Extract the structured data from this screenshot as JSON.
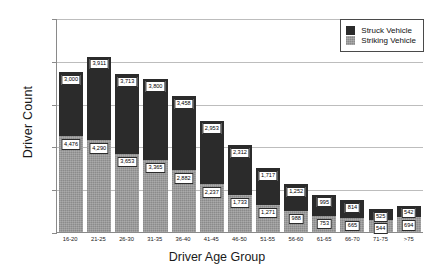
{
  "chart_data": {
    "type": "bar",
    "stacked": true,
    "title": "",
    "xlabel": "Driver Age Group",
    "ylabel": "Driver Count",
    "ylim": [
      0,
      10000
    ],
    "yticks": [
      "0",
      "2,000",
      "4,000",
      "6,000",
      "8,000",
      "10,000"
    ],
    "ytick_values": [
      0,
      2000,
      4000,
      6000,
      8000,
      10000
    ],
    "grid": true,
    "legend_position": "top-right",
    "categories": [
      "16-20",
      "21-25",
      "26-30",
      "31-35",
      "36-40",
      "41-45",
      "46-50",
      "51-55",
      "56-60",
      "61-65",
      "66-70",
      "71-75",
      ">75"
    ],
    "series": [
      {
        "name": "Struck Vehicle",
        "color": "#2b2b2b",
        "values": [
          3000,
          3911,
          3713,
          3800,
          3458,
          2953,
          2312,
          1717,
          1252,
          995,
          814,
          525,
          542
        ]
      },
      {
        "name": "Striking Vehicle",
        "color": "#9a9a9a",
        "values": [
          4476,
          4290,
          3653,
          3365,
          2882,
          2237,
          1733,
          1271,
          988,
          753,
          665,
          544,
          694
        ]
      }
    ],
    "labels": {
      "struck": [
        "3,000",
        "3,911",
        "3,713",
        "3,800",
        "3,458",
        "2,953",
        "2,312",
        "1,717",
        "1,252",
        "995",
        "814",
        "525",
        "542"
      ],
      "striking": [
        "4,476",
        "4,290",
        "3,653",
        "3,365",
        "2,882",
        "2,237",
        "1,733",
        "1,271",
        "988",
        "753",
        "665",
        "544",
        "694"
      ]
    }
  },
  "legend": {
    "items": [
      {
        "label": "Struck Vehicle"
      },
      {
        "label": "Striking Vehicle"
      }
    ]
  }
}
